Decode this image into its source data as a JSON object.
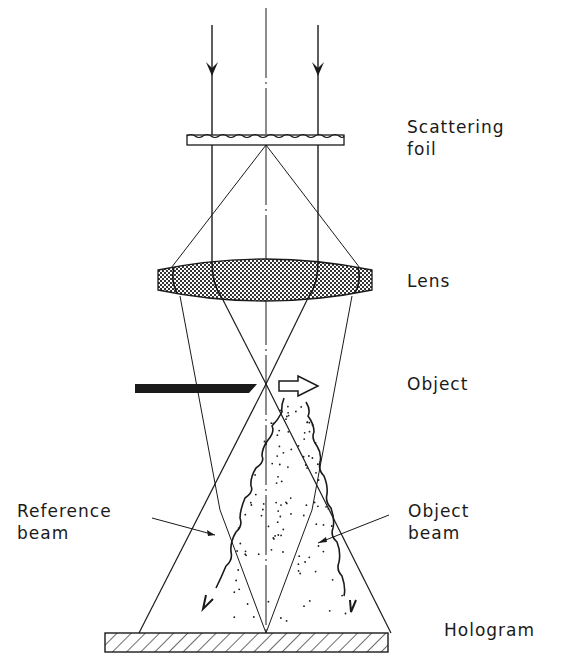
{
  "labels": {
    "scattering_foil": [
      "Scattering",
      "foil"
    ],
    "lens": "Lens",
    "object": "Object",
    "reference_beam": [
      "Reference",
      "beam"
    ],
    "object_beam": [
      "Object",
      "beam"
    ],
    "hologram": "Hologram"
  },
  "colors": {
    "ink": "#1a1a1a",
    "background": "#ffffff"
  }
}
